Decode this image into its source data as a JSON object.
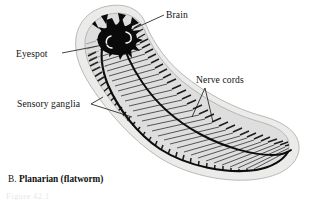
{
  "figure": {
    "caption_letter": "B.",
    "caption_name": "Planarian (flatworm)",
    "figure_number": "Figure 42.1",
    "background_color": "#ffffff",
    "ink_color": "#131313"
  },
  "labels": {
    "brain": "Brain",
    "eyespot": "Eyespot",
    "sensory_ganglia": "Sensory ganglia",
    "nerve_cords": "Nerve cords"
  },
  "anatomy": {
    "body_outline_color": "#d8d8d6",
    "body_fill_color": "#e9e9e7",
    "interior_fill_color": "#dcdcda",
    "brain_color": "#090909",
    "nerve_cord_color": "#101010",
    "commissure_color": "#2a2a2a",
    "eyespot_color": "#f4f4f2",
    "parts": [
      {
        "name": "brain",
        "description": "dark star-shaped ganglionic mass at anterior end"
      },
      {
        "name": "eyespot",
        "description": "pair of pale crescent ocelli within the brain mass"
      },
      {
        "name": "ventral-nerve-cord-left",
        "description": "longitudinal dark cord running head to tail"
      },
      {
        "name": "ventral-nerve-cord-right",
        "description": "longitudinal dark cord running head to tail"
      },
      {
        "name": "transverse-commissures",
        "description": "ladder rungs linking the two nerve cords"
      },
      {
        "name": "sensory-ganglia",
        "description": "short lateral nerve branches along the body margins"
      }
    ]
  }
}
